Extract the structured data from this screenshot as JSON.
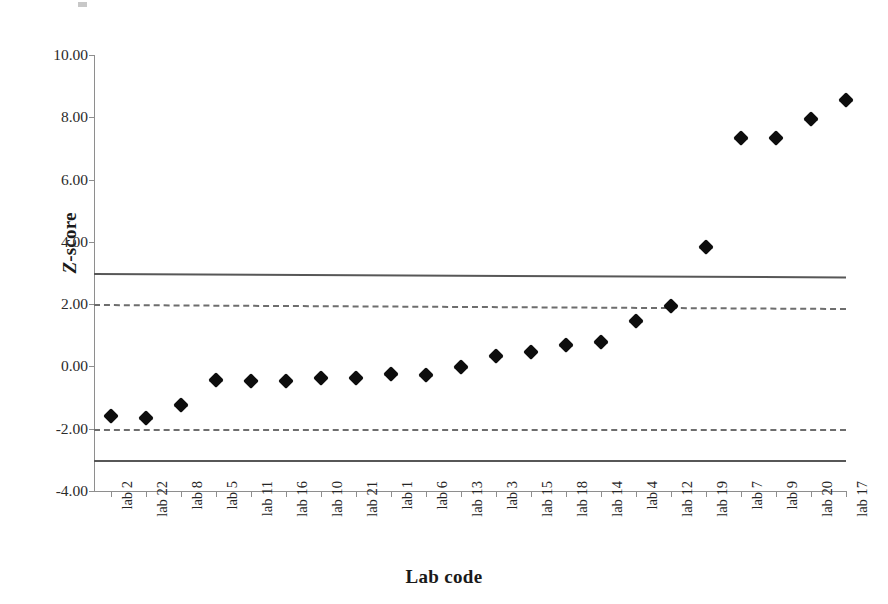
{
  "chart_data": {
    "type": "scatter",
    "title": "",
    "xlabel": "Lab code",
    "ylabel": "Z-score",
    "categories": [
      "lab 2",
      "lab 22",
      "lab 8",
      "lab 5",
      "lab 11",
      "lab 16",
      "lab 10",
      "lab 21",
      "lab 1",
      "lab 6",
      "lab 13",
      "lab 3",
      "lab 15",
      "lab 18",
      "lab 14",
      "lab 4",
      "lab 12",
      "lab 19",
      "lab 7",
      "lab 9",
      "lab 20",
      "lab 17"
    ],
    "values": [
      -1.6,
      -1.66,
      -1.25,
      -0.45,
      -0.47,
      -0.48,
      -0.36,
      -0.36,
      -0.24,
      -0.26,
      -0.03,
      0.32,
      0.45,
      0.7,
      0.79,
      1.47,
      1.95,
      3.85,
      7.35,
      7.35,
      7.96,
      8.55
    ],
    "ylim": [
      -4.0,
      10.0
    ],
    "ytick_values": [
      10.0,
      8.0,
      6.0,
      4.0,
      2.0,
      0.0,
      -2.0,
      -4.0
    ],
    "ytick_labels": [
      "10.00",
      "8.00",
      "6.00",
      "4.00",
      "2.00",
      "0.00",
      "-2.00",
      "-4.00"
    ],
    "grid": false,
    "legend": "none",
    "marker": "diamond",
    "marker_color": "#0d0d0d",
    "reference_lines": [
      {
        "name": "upper-action-limit",
        "value": 3.0,
        "style": "solid",
        "color": "#575757"
      },
      {
        "name": "upper-warning-limit",
        "value": 2.0,
        "style": "dashed",
        "color": "#6d6d6d"
      },
      {
        "name": "lower-warning-limit",
        "value": -2.0,
        "style": "dashed",
        "color": "#6d6d6d"
      },
      {
        "name": "lower-action-limit",
        "value": -3.0,
        "style": "solid",
        "color": "#575757"
      }
    ]
  },
  "axes": {
    "y_title_part1": "Z",
    "y_title_part2": "-score",
    "x_title": "Lab code"
  }
}
